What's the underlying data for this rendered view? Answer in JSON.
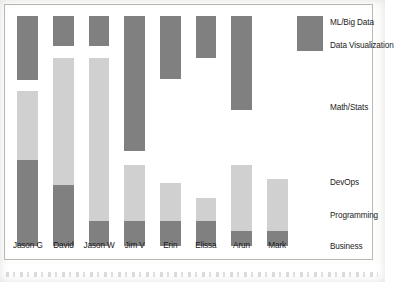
{
  "chart_data": {
    "type": "bar",
    "subtype": "stacked-bar-skill-profile",
    "title": "",
    "subtitle": "",
    "xlabel": "",
    "ylabel": "",
    "grid": false,
    "legend_position": "right",
    "orientation": "vertical",
    "stack_order_top_to_bottom": [
      "ML/Big Data",
      "Data Visualization",
      "Math/Stats",
      "DevOps",
      "Programming",
      "Business"
    ],
    "categories": [
      "Jason G",
      "David",
      "Jason W",
      "Jim V",
      "Erin",
      "Elissa",
      "Arun",
      "Mark"
    ],
    "series": [
      {
        "name": "ML/Big Data",
        "color": "#808081",
        "values": [
          22,
          13,
          13,
          49,
          21,
          14,
          34,
          0
        ]
      },
      {
        "name": "Data Visualization",
        "color": "#cfd0cf",
        "values": [
          0,
          0,
          0,
          0,
          0,
          0,
          0,
          0
        ]
      },
      {
        "name": "Math/Stats",
        "color": "#cfd0cf",
        "values": [
          36,
          71,
          73,
          0,
          0,
          0,
          0,
          0
        ]
      },
      {
        "name": "DevOps",
        "color": "#cfd0cf",
        "values": [
          0,
          0,
          0,
          0,
          0,
          0,
          0,
          0
        ]
      },
      {
        "name": "Programming",
        "color": "#cfd0cf",
        "values": [
          0,
          0,
          0,
          28,
          19,
          11,
          32,
          31
        ]
      },
      {
        "name": "Business",
        "color": "#808081",
        "values": [
          40,
          21,
          8,
          9,
          9,
          9,
          5,
          5
        ]
      }
    ],
    "legend_entries": [
      {
        "label": "ML/Big Data",
        "color": "#808081"
      },
      {
        "label": "Data Visualization",
        "color": "#cfd0cf"
      },
      {
        "label": "Math/Stats",
        "color": "#cfd0cf"
      },
      {
        "label": "DevOps",
        "color": "#cfd0cf"
      },
      {
        "label": "Programming",
        "color": "#cfd0cf"
      },
      {
        "label": "Business",
        "color": "#808081"
      }
    ],
    "bars": [
      {
        "category": "Jason G",
        "segments": [
          {
            "label": "ML/Big Data",
            "top_pct": 3.2,
            "height_pct": 25.6,
            "tone": "dark"
          },
          {
            "label": "Math/Stats",
            "top_pct": 33.2,
            "height_pct": 27.5,
            "tone": "light"
          },
          {
            "label": "Business",
            "top_pct": 60.7,
            "height_pct": 34.5,
            "tone": "dark"
          }
        ]
      },
      {
        "category": "David",
        "segments": [
          {
            "label": "ML/Big Data",
            "top_pct": 3.2,
            "height_pct": 12.0,
            "tone": "dark"
          },
          {
            "label": "Math/Stats",
            "top_pct": 19.8,
            "height_pct": 51.0,
            "tone": "light"
          },
          {
            "label": "Business",
            "top_pct": 70.8,
            "height_pct": 24.4,
            "tone": "dark"
          }
        ]
      },
      {
        "category": "Jason W",
        "segments": [
          {
            "label": "ML/Big Data",
            "top_pct": 3.2,
            "height_pct": 12.0,
            "tone": "dark"
          },
          {
            "label": "Math/Stats",
            "top_pct": 19.8,
            "height_pct": 65.2,
            "tone": "light"
          },
          {
            "label": "Business",
            "top_pct": 85.0,
            "height_pct": 10.2,
            "tone": "dark"
          }
        ]
      },
      {
        "category": "Jim V",
        "segments": [
          {
            "label": "ML/Big Data",
            "top_pct": 3.2,
            "height_pct": 54.0,
            "tone": "dark"
          },
          {
            "label": "Programming",
            "top_pct": 62.8,
            "height_pct": 22.2,
            "tone": "light"
          },
          {
            "label": "Business",
            "top_pct": 85.0,
            "height_pct": 10.2,
            "tone": "dark"
          }
        ]
      },
      {
        "category": "Erin",
        "segments": [
          {
            "label": "ML/Big Data",
            "top_pct": 3.2,
            "height_pct": 25.0,
            "tone": "dark"
          },
          {
            "label": "Programming",
            "top_pct": 70.0,
            "height_pct": 15.0,
            "tone": "light"
          },
          {
            "label": "Business",
            "top_pct": 85.0,
            "height_pct": 10.2,
            "tone": "dark"
          }
        ]
      },
      {
        "category": "Elissa",
        "segments": [
          {
            "label": "ML/Big Data",
            "top_pct": 3.2,
            "height_pct": 16.8,
            "tone": "dark"
          },
          {
            "label": "Programming",
            "top_pct": 76.0,
            "height_pct": 9.0,
            "tone": "light"
          },
          {
            "label": "Business",
            "top_pct": 85.0,
            "height_pct": 10.2,
            "tone": "dark"
          }
        ]
      },
      {
        "category": "Arun",
        "segments": [
          {
            "label": "ML/Big Data",
            "top_pct": 3.2,
            "height_pct": 37.5,
            "tone": "dark"
          },
          {
            "label": "Programming",
            "top_pct": 62.8,
            "height_pct": 26.5,
            "tone": "light"
          },
          {
            "label": "Business",
            "top_pct": 89.3,
            "height_pct": 5.9,
            "tone": "dark"
          }
        ]
      },
      {
        "category": "Mark",
        "segments": [
          {
            "label": "Programming",
            "top_pct": 68.5,
            "height_pct": 20.8,
            "tone": "light"
          },
          {
            "label": "Business",
            "top_pct": 89.3,
            "height_pct": 5.9,
            "tone": "dark"
          }
        ]
      }
    ],
    "legend_items_layout": [
      {
        "label": "ML/Big Data",
        "y_pct": 4.0,
        "tone": "dark",
        "has_swatch": true,
        "swatch_top_pct": 3.2,
        "swatch_height_pct": 14.0
      },
      {
        "label": "Data Visualization",
        "y_pct": 13.0,
        "tone": "dark",
        "has_swatch": false,
        "swatch_top_pct": 0,
        "swatch_height_pct": 0
      },
      {
        "label": "Math/Stats",
        "y_pct": 38.0,
        "tone": "light",
        "has_swatch": false,
        "swatch_top_pct": 0,
        "swatch_height_pct": 0
      },
      {
        "label": "DevOps",
        "y_pct": 68.0,
        "tone": "light",
        "has_swatch": false,
        "swatch_top_pct": 0,
        "swatch_height_pct": 0
      },
      {
        "label": "Programming",
        "y_pct": 81.0,
        "tone": "light",
        "has_swatch": false,
        "swatch_top_pct": 0,
        "swatch_height_pct": 0
      },
      {
        "label": "Business",
        "y_pct": 93.5,
        "tone": "dark",
        "has_swatch": false,
        "swatch_top_pct": 0,
        "swatch_height_pct": 0
      }
    ],
    "colors": {
      "dark_segment": "#808081",
      "light_segment": "#cfd0cf",
      "text": "#1b1b1b",
      "frame_border": "#b9b9b5",
      "plot_background": "#ffffff",
      "page_background": "#fdfdfc"
    },
    "axis": {
      "x_tick_labels": [
        "Jason G",
        "David",
        "Jason W",
        "Jim V",
        "Erin",
        "Elissa",
        "Arun",
        "Mark"
      ],
      "y_tick_labels": [],
      "x_axis_visible": false,
      "y_axis_visible": false
    }
  }
}
